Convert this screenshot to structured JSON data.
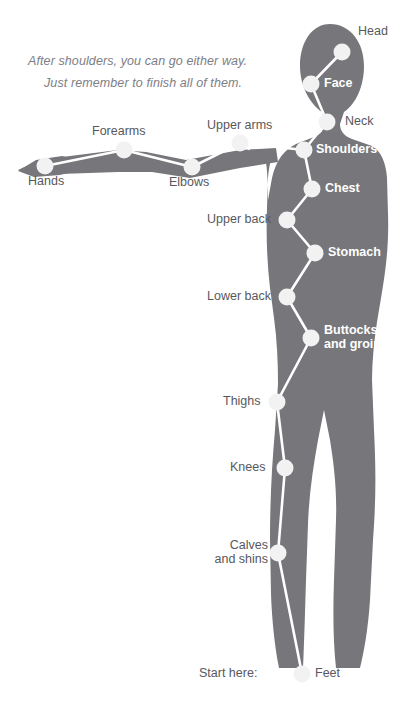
{
  "canvas": {
    "width": 408,
    "height": 710,
    "background": "#ffffff"
  },
  "colors": {
    "body_silhouette": "#77777b",
    "node_fill": "#f2f2f2",
    "edge_line": "#ffffff",
    "label_on_white": "#58585c",
    "label_on_body": "#ffffff",
    "note_text": "#7d7d84"
  },
  "note": {
    "line1": "After shoulders, you can go either way.",
    "line2": "Just remember to finish all of them."
  },
  "start_marker": {
    "label": "Start here:"
  },
  "nodes": [
    {
      "id": "head",
      "label": "Head",
      "x": 342,
      "y": 52,
      "label_side": "right",
      "label_style": "dark"
    },
    {
      "id": "face",
      "label": "Face",
      "x": 311,
      "y": 84,
      "label_side": "right",
      "label_style": "light"
    },
    {
      "id": "neck",
      "label": "Neck",
      "x": 327,
      "y": 122,
      "label_side": "right",
      "label_style": "dark"
    },
    {
      "id": "shoulders",
      "label": "Shoulders",
      "x": 304,
      "y": 150,
      "label_side": "right",
      "label_style": "light"
    },
    {
      "id": "upper-arms",
      "label": "Upper arms",
      "x": 240,
      "y": 143,
      "label_side": "above",
      "label_style": "dark"
    },
    {
      "id": "elbows",
      "label": "Elbows",
      "x": 192,
      "y": 167,
      "label_side": "below",
      "label_style": "dark"
    },
    {
      "id": "forearms",
      "label": "Forearms",
      "x": 124,
      "y": 150,
      "label_side": "above",
      "label_style": "dark"
    },
    {
      "id": "hands",
      "label": "Hands",
      "x": 45,
      "y": 166,
      "label_side": "below",
      "label_style": "dark"
    },
    {
      "id": "chest",
      "label": "Chest",
      "x": 312,
      "y": 189,
      "label_side": "right",
      "label_style": "light"
    },
    {
      "id": "upper-back",
      "label": "Upper back",
      "x": 287,
      "y": 220,
      "label_side": "left",
      "label_style": "dark"
    },
    {
      "id": "stomach",
      "label": "Stomach",
      "x": 315,
      "y": 253,
      "label_side": "right",
      "label_style": "light"
    },
    {
      "id": "lower-back",
      "label": "Lower back",
      "x": 287,
      "y": 297,
      "label_side": "left",
      "label_style": "dark"
    },
    {
      "id": "buttocks",
      "label": "Buttocks\nand groin",
      "x": 311,
      "y": 338,
      "label_side": "right",
      "label_style": "light"
    },
    {
      "id": "thighs",
      "label": "Thighs",
      "x": 277,
      "y": 402,
      "label_side": "left",
      "label_style": "dark"
    },
    {
      "id": "knees",
      "label": "Knees",
      "x": 285,
      "y": 468,
      "label_side": "left",
      "label_style": "dark"
    },
    {
      "id": "calves",
      "label": "Calves\nand shins",
      "x": 278,
      "y": 553,
      "label_side": "left",
      "label_style": "dark"
    },
    {
      "id": "feet",
      "label": "Feet",
      "x": 302,
      "y": 674,
      "label_side": "right",
      "label_style": "dark"
    }
  ],
  "edges": [
    {
      "from": "feet",
      "to": "calves"
    },
    {
      "from": "calves",
      "to": "knees"
    },
    {
      "from": "knees",
      "to": "thighs"
    },
    {
      "from": "thighs",
      "to": "buttocks"
    },
    {
      "from": "buttocks",
      "to": "lower-back"
    },
    {
      "from": "lower-back",
      "to": "stomach"
    },
    {
      "from": "stomach",
      "to": "upper-back"
    },
    {
      "from": "upper-back",
      "to": "chest"
    },
    {
      "from": "chest",
      "to": "shoulders"
    },
    {
      "from": "shoulders",
      "to": "neck"
    },
    {
      "from": "neck",
      "to": "face"
    },
    {
      "from": "face",
      "to": "head"
    },
    {
      "from": "shoulders",
      "to": "upper-arms",
      "arrow": true
    },
    {
      "from": "upper-arms",
      "to": "elbows"
    },
    {
      "from": "elbows",
      "to": "forearms"
    },
    {
      "from": "forearms",
      "to": "hands"
    }
  ]
}
